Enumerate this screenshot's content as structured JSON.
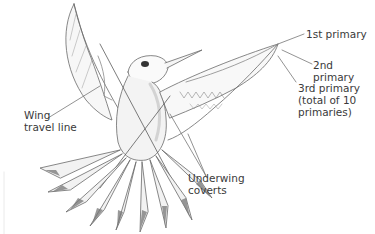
{
  "diagram": {
    "labels": {
      "first_primary": "1st primary",
      "second_primary": "2nd primary",
      "third_primary": "3rd primary\n(total of 10\nprimaries)",
      "wing_travel_line": "Wing\ntravel line",
      "underwing_coverts": "Underwing\ncoverts"
    },
    "colors": {
      "line": "#555555",
      "text": "#3a3a3a",
      "shade": "#8a8a8a",
      "background": "#ffffff"
    }
  }
}
